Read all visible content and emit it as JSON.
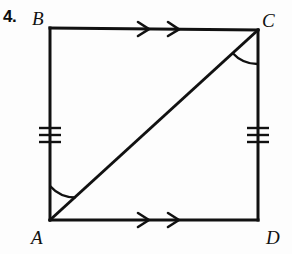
{
  "figure": {
    "problem_number": "4.",
    "shape_name": "quadrilateral-abcd",
    "stroke_color": "#111111",
    "background_color": "#fdfdfd",
    "vertices": [
      {
        "name": "B",
        "label": "B",
        "x": 50,
        "y": 28,
        "label_x": 32,
        "label_y": 9
      },
      {
        "name": "C",
        "label": "C",
        "x": 258,
        "y": 30,
        "label_x": 262,
        "label_y": 11
      },
      {
        "name": "D",
        "label": "D",
        "x": 258,
        "y": 220,
        "label_x": 266,
        "label_y": 228
      },
      {
        "name": "A",
        "label": "A",
        "x": 50,
        "y": 220,
        "label_x": 31,
        "label_y": 228
      }
    ],
    "segments": [
      {
        "name": "segment-bc",
        "from": "B",
        "to": "C",
        "marks": "double-arrow"
      },
      {
        "name": "segment-cd",
        "from": "C",
        "to": "D",
        "marks": "triple-tick"
      },
      {
        "name": "segment-ad",
        "from": "A",
        "to": "D",
        "marks": "double-arrow"
      },
      {
        "name": "segment-ab",
        "from": "A",
        "to": "B",
        "marks": "triple-tick"
      },
      {
        "name": "diagonal-ac",
        "from": "A",
        "to": "C",
        "marks": "none"
      }
    ],
    "angle_arcs": [
      {
        "name": "angle-bac",
        "vertex": "A",
        "between": [
          "B",
          "C"
        ]
      },
      {
        "name": "angle-acd",
        "vertex": "C",
        "between": [
          "A",
          "D"
        ]
      }
    ]
  }
}
